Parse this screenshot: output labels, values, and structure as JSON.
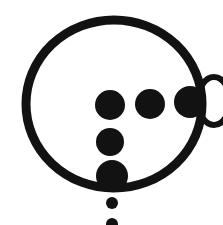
{
  "image": {
    "kind": "monochrome-glyph",
    "title": "Circle glyph with dots and side loop",
    "alt_text": "A thick hand-drawn black circle outline enclosing four solid dots, with a solid dot merging into a hollow oval loop at the right edge and a small dot below the circle",
    "background_color": "#ffffff",
    "ink_color": "#121212",
    "width": 223,
    "height": 225
  },
  "shapes": {
    "main_circle": {
      "name": "large-circle-outline",
      "center_x": 114,
      "center_y": 104,
      "radius_x": 88,
      "radius_y": 84,
      "stroke_width": 9,
      "filled": false
    },
    "side_loop": {
      "name": "hollow-oval-loop",
      "center_x": 214,
      "center_y": 101,
      "radius_x": 16,
      "radius_y": 24,
      "stroke_width": 6,
      "filled": false
    },
    "dots": [
      {
        "name": "dot-upper-left",
        "center_x": 110,
        "center_y": 105,
        "radius": 15,
        "filled": true
      },
      {
        "name": "dot-upper-middle",
        "center_x": 150,
        "center_y": 104,
        "radius": 15,
        "filled": true
      },
      {
        "name": "dot-right-edge",
        "center_x": 190,
        "center_y": 102,
        "radius": 16,
        "filled": true
      },
      {
        "name": "dot-middle-column",
        "center_x": 110,
        "center_y": 142,
        "radius": 14,
        "filled": true
      },
      {
        "name": "dot-lower-column",
        "center_x": 112,
        "center_y": 176,
        "radius": 16,
        "filled": true
      },
      {
        "name": "dot-small-below-circle",
        "center_x": 112,
        "center_y": 203,
        "radius": 6,
        "filled": true
      },
      {
        "name": "mark-clipped-bottom-edge",
        "center_x": 112,
        "center_y": 224,
        "radius": 6,
        "filled": true
      }
    ]
  }
}
